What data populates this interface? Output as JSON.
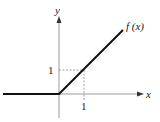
{
  "diagram": {
    "type": "function-plot",
    "function_label": "f (x)",
    "x_axis_label": "x",
    "y_axis_label": "y",
    "x_tick_label": "1",
    "y_tick_label": "1",
    "colors": {
      "curve": "#111111",
      "axes": "#999999",
      "guides": "#888888",
      "text": "#222222"
    },
    "segments": [
      {
        "name": "flat",
        "from": [
          -1.96,
          0
        ],
        "to": [
          0,
          0
        ]
      },
      {
        "name": "linear",
        "from": [
          0,
          0
        ],
        "to": [
          2.5,
          2.5
        ]
      }
    ]
  }
}
